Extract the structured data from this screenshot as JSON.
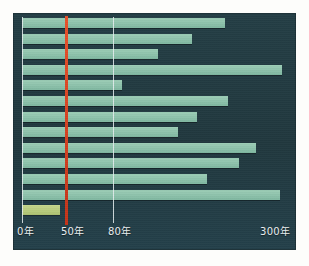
{
  "chart_data": {
    "type": "bar",
    "orientation": "horizontal",
    "title": "",
    "subtitle": "",
    "xlabel": "",
    "ylabel": "",
    "grid": true,
    "legend": null,
    "scale": "nonlinear-compressed",
    "axis": {
      "ticks": [
        {
          "label": "0年",
          "value": 0,
          "x_px": 22,
          "gridline": true,
          "gridline_color": "#e8eef0"
        },
        {
          "label": "50年",
          "value": 50,
          "x_px": 66,
          "gridline": true,
          "gridline_color": "#d8431e"
        },
        {
          "label": "80年",
          "value": 80,
          "x_px": 113,
          "gridline": true,
          "gridline_color": "#e8eef0"
        },
        {
          "label": "300年",
          "value": 300,
          "x_px": 290,
          "gridline": false,
          "gridline_color": null
        }
      ],
      "xlim": [
        0,
        300
      ],
      "unit": "年"
    },
    "categories": [
      "1",
      "2",
      "3",
      "4",
      "5",
      "6",
      "7",
      "8",
      "9",
      "10",
      "11",
      "12",
      "13"
    ],
    "values": [
      210,
      150,
      100,
      290,
      90,
      215,
      160,
      125,
      255,
      230,
      180,
      285,
      42
    ],
    "bar_end_px": [
      225,
      192,
      158,
      282,
      122,
      228,
      197,
      178,
      256,
      239,
      207,
      280,
      60
    ],
    "series": [
      {
        "name": "bars",
        "color": "#8fc4ad",
        "highlight_color": "#bacd7f",
        "highlight_index": 12,
        "values": [
          210,
          150,
          100,
          290,
          90,
          215,
          160,
          125,
          255,
          230,
          180,
          285,
          42
        ]
      }
    ]
  },
  "panel": {
    "background": "#233c42",
    "border": "#1b3036"
  },
  "page": {
    "background": "#fdfdfb"
  }
}
